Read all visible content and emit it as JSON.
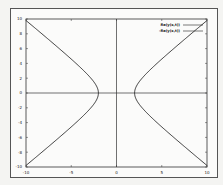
{
  "chart_data": {
    "type": "line",
    "title": "",
    "xlabel": "",
    "ylabel": "",
    "xlim": [
      -10,
      10
    ],
    "ylim": [
      -10,
      10
    ],
    "x_ticks": [
      "-10",
      "-5",
      "0",
      "5",
      "10"
    ],
    "y_ticks": [
      "10",
      "8",
      "6",
      "4",
      "2",
      "0",
      "-2",
      "-4",
      "-6",
      "-8",
      "-10"
    ],
    "grid": false,
    "zero_lines": true,
    "legend_position": "upper right",
    "series": [
      {
        "name": "Re(y(x,t))",
        "description": "right branch of hyperbola x^2 - y^2 = 4",
        "x": [
          10.2,
          8.2,
          6.3,
          4.5,
          2.8,
          2.0,
          2.8,
          4.5,
          6.3,
          8.2,
          10.2
        ],
        "y": [
          -10,
          -8,
          -6,
          -4,
          -2,
          0,
          2,
          4,
          6,
          8,
          10
        ]
      },
      {
        "name": "-Re(y(x,t))",
        "description": "left branch of hyperbola x^2 - y^2 = 4",
        "x": [
          -10.2,
          -8.2,
          -6.3,
          -4.5,
          -2.8,
          -2.0,
          -2.8,
          -4.5,
          -6.3,
          -8.2,
          -10.2
        ],
        "y": [
          -10,
          -8,
          -6,
          -4,
          -2,
          0,
          2,
          4,
          6,
          8,
          10
        ]
      }
    ],
    "color": "#222222"
  },
  "legend": {
    "entries": [
      "Re(y(x,t))",
      "-Re(y(x,t))"
    ]
  }
}
